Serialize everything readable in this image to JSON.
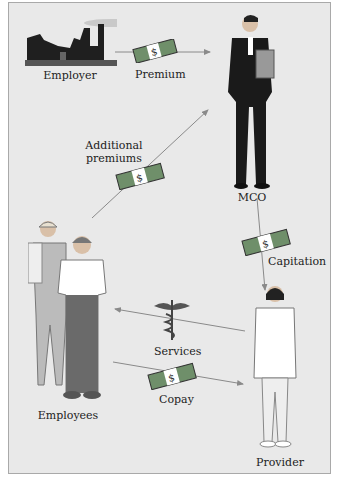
{
  "diagram": {
    "nodes": {
      "employer": {
        "label": "Employer",
        "icon": "factory-icon"
      },
      "mco": {
        "label": "MCO",
        "icon": "businessman-icon"
      },
      "employees": {
        "label": "Employees",
        "icon": "workers-icon"
      },
      "provider": {
        "label": "Provider",
        "icon": "doctor-icon"
      }
    },
    "edges": [
      {
        "from": "employer",
        "to": "mco",
        "label": "Premium",
        "icon": "money-icon"
      },
      {
        "from": "employees",
        "to": "mco",
        "label_line1": "Additional",
        "label_line2": "premiums",
        "icon": "money-icon"
      },
      {
        "from": "mco",
        "to": "provider",
        "label": "Capitation",
        "icon": "money-icon"
      },
      {
        "from": "provider",
        "to": "employees",
        "label": "Services",
        "icon": "caduceus-icon"
      },
      {
        "from": "employees",
        "to": "provider",
        "label": "Copay",
        "icon": "money-icon"
      }
    ],
    "colors": {
      "background": "#e9e9e9",
      "border": "#a9a9a9",
      "arrow": "#8a8a8a",
      "money": "#6f8f6a"
    }
  }
}
